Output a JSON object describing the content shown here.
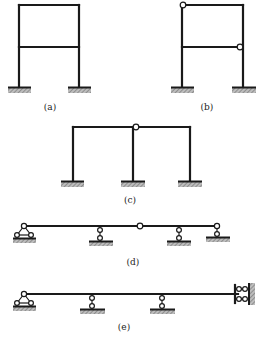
{
  "figure": {
    "type": "structural-mechanics-diagrams",
    "colors": {
      "line": "#1a1a1a",
      "hatch": "#888888",
      "background": "#ffffff"
    },
    "subfigures": [
      {
        "id": "a",
        "label": "(a)",
        "description": "Two-story single-bay rigid frame, two fixed supports"
      },
      {
        "id": "b",
        "label": "(b)",
        "description": "Two-story single-bay frame with hinge at top-left joint and hinge at right end of middle beam, two fixed supports"
      },
      {
        "id": "c",
        "label": "(c)",
        "description": "Two-bay single-story frame with hinge in top beam above middle column, three fixed supports"
      },
      {
        "id": "d",
        "label": "(d)",
        "description": "Continuous beam with pin support at left, three roller supports, and an internal hinge"
      },
      {
        "id": "e",
        "label": "(e)",
        "description": "Continuous beam with pin support at left, two roller supports, and a sliding (guided) support against a wall at right"
      }
    ]
  },
  "labels": {
    "a": "(a)",
    "b": "(b)",
    "c": "(c)",
    "d": "(d)",
    "e": "(e)"
  }
}
